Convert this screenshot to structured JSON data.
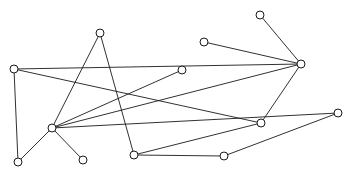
{
  "figure": {
    "title": "",
    "type": "node-link-graph",
    "width": 350,
    "height": 178,
    "background_color": "#ffffff",
    "edge_color": "#1a1a1a",
    "node_fill_color": "#ffffff",
    "node_stroke_color": "#1a1a1a",
    "node_radius": 4.0,
    "node_count": 13,
    "edge_count": 16
  },
  "chart_data": {
    "type": "scatter",
    "title": "",
    "xlabel": "",
    "ylabel": "",
    "grid": false,
    "legend": "none",
    "xlim": [
      0,
      350
    ],
    "ylim": [
      0,
      178
    ],
    "nodes": [
      {
        "id": "n1",
        "x": 14,
        "y": 69,
        "label": ""
      },
      {
        "id": "n2",
        "x": 100,
        "y": 33,
        "label": ""
      },
      {
        "id": "n3",
        "x": 52,
        "y": 128,
        "label": ""
      },
      {
        "id": "n4",
        "x": 18,
        "y": 162,
        "label": ""
      },
      {
        "id": "n5",
        "x": 83,
        "y": 160,
        "label": ""
      },
      {
        "id": "n6",
        "x": 134,
        "y": 155,
        "label": ""
      },
      {
        "id": "n7",
        "x": 182,
        "y": 70,
        "label": ""
      },
      {
        "id": "n8",
        "x": 204,
        "y": 42,
        "label": ""
      },
      {
        "id": "n9",
        "x": 224,
        "y": 156,
        "label": ""
      },
      {
        "id": "n10",
        "x": 260,
        "y": 15,
        "label": ""
      },
      {
        "id": "n11",
        "x": 301,
        "y": 64,
        "label": ""
      },
      {
        "id": "n12",
        "x": 261,
        "y": 123,
        "label": ""
      },
      {
        "id": "n13",
        "x": 338,
        "y": 113,
        "label": ""
      }
    ],
    "edges": [
      {
        "source": "n1",
        "target": "n4"
      },
      {
        "source": "n1",
        "target": "n12"
      },
      {
        "source": "n1",
        "target": "n11"
      },
      {
        "source": "n3",
        "target": "n4"
      },
      {
        "source": "n3",
        "target": "n5"
      },
      {
        "source": "n3",
        "target": "n2"
      },
      {
        "source": "n3",
        "target": "n11"
      },
      {
        "source": "n3",
        "target": "n13"
      },
      {
        "source": "n3",
        "target": "n7"
      },
      {
        "source": "n2",
        "target": "n6"
      },
      {
        "source": "n6",
        "target": "n9"
      },
      {
        "source": "n6",
        "target": "n12"
      },
      {
        "source": "n9",
        "target": "n13"
      },
      {
        "source": "n8",
        "target": "n11"
      },
      {
        "source": "n10",
        "target": "n11"
      },
      {
        "source": "n11",
        "target": "n12"
      }
    ]
  }
}
